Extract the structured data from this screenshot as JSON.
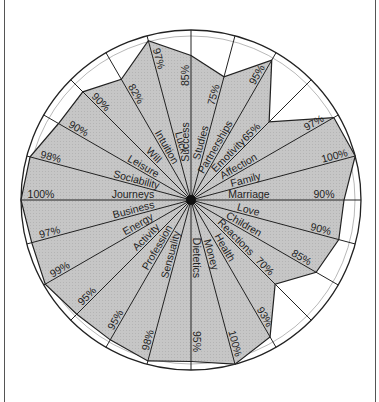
{
  "chart_data": {
    "type": "radar",
    "title": "",
    "center": [
      191,
      200
    ],
    "radius": 170,
    "start_angle_deg": 0,
    "direction": "clockwise",
    "categories": [
      "Success",
      "Studies",
      "Partnerships",
      "Emotivity",
      "Affection",
      "Family",
      "Marriage",
      "Love",
      "Children",
      "Reactions",
      "Health",
      "Money",
      "Dietetics",
      "Sensuality",
      "Profession",
      "Activity",
      "Energy",
      "Business",
      "Journeys",
      "Sociability",
      "Leisure",
      "Will",
      "Intuition",
      "Luck"
    ],
    "values": [
      85,
      75,
      95,
      65,
      97,
      100,
      90,
      90,
      85,
      70,
      93,
      100,
      95,
      98,
      95,
      95,
      99,
      97,
      100,
      98,
      90,
      90,
      82,
      97
    ],
    "value_labels": [
      "85%",
      "75%",
      "95%",
      "65%",
      "97%",
      "100%",
      "90%",
      "90%",
      "85%",
      "70%",
      "93%",
      "100%",
      "95%",
      "98%",
      "95%",
      "95%",
      "99%",
      "97%",
      "100%",
      "98%",
      "90%",
      "90%",
      "82%",
      "97%"
    ],
    "fill_color": "#c4c4c4",
    "line_color": "#222222",
    "background_color": "#ffffff"
  }
}
